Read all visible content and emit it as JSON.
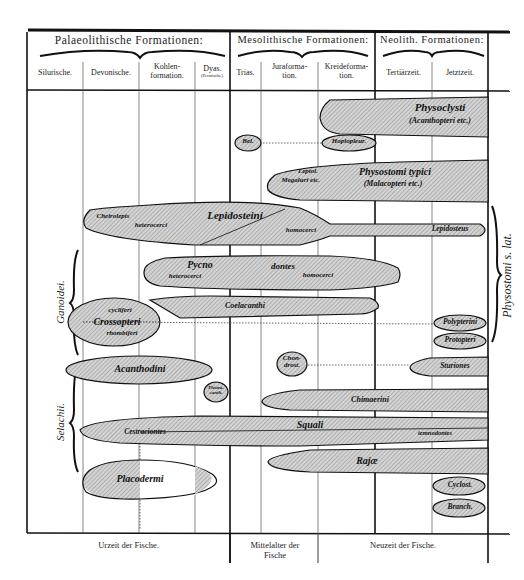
{
  "header": {
    "eras": [
      {
        "label": "Palaeolithische Formationen:"
      },
      {
        "label": "Mesolithische Formationen:"
      },
      {
        "label": "Neolith. Formationen:"
      }
    ],
    "periods": [
      {
        "label": "Silurische."
      },
      {
        "label": "Devonische."
      },
      {
        "label": "Kohlen-\nformation."
      },
      {
        "label": "Dyas.",
        "sub": "(Permische)."
      },
      {
        "label": "Trias."
      },
      {
        "label": "Juraforma-\ntion."
      },
      {
        "label": "Kreideforma-\ntion."
      },
      {
        "label": "Tertiärzeit."
      },
      {
        "label": "Jetztzeit."
      }
    ]
  },
  "side_labels": {
    "left_upper": "Ganoidei.",
    "left_lower": "Selachii.",
    "right": "Physostomi s. lat."
  },
  "taxa": {
    "physoclysti": "Physoclysti",
    "physoclysti_sub": "(Acanthopteri etc.)",
    "bel": "Bel.",
    "hoplopleur": "Hoplopleur.",
    "leptol": "Leptol.",
    "megaluri": "Megaluri etc.",
    "physostomi_typici": "Physostomi typici",
    "malacopteri": "(Malacopteri etc.)",
    "cheirolepis": "Cheirolepis",
    "heterocerci_1": "heterocerci",
    "lepidosteini": "Lepidosteini",
    "homocerci_1": "homocerci",
    "lepidosteus": "Lepidosteus",
    "pycno": "Pycno",
    "heterocerci_2": "heterocerci",
    "dontes": "dontes",
    "homocerci_2": "homocerci",
    "cycliferi": "cycliferi",
    "crossopteri": "Crossopteri",
    "rhombiferi": "rhombiferi",
    "coelacanthi": "Coelacanthi",
    "polypterini": "Polypterini",
    "protopteri": "Protopteri",
    "acanthodini": "Acanthodini",
    "chondrost": "Chon-\ndrost.",
    "sturiones": "Sturiones",
    "pleuracanth": "Pleura-\ncanth.",
    "chimaerini": "Chimaerini",
    "cestraciontes": "Cestraciontes",
    "squali": "Squali",
    "tectospondyli": "temnodontes",
    "rajae": "Rajæ",
    "placodermi": "Placodermi",
    "cyclost": "Cyclost.",
    "branch": "Branch."
  },
  "footer": {
    "urzeit": "Urzeit der Fische.",
    "mittelalter": "Mittelalter der\nFische",
    "neuzeit": "Neuzeit der Fische."
  },
  "colors": {
    "ink": "#1a1a1a",
    "hatch_fill": "#c9c9c9",
    "paper": "#ffffff"
  }
}
